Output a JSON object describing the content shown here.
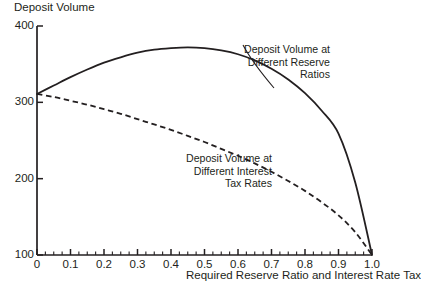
{
  "chart_data": {
    "type": "line",
    "title": "",
    "ylabel": "Deposit Volume",
    "xlabel": "Required Reserve Ratio and Interest Rate Tax",
    "xlim": [
      0,
      1.0
    ],
    "ylim": [
      100,
      400
    ],
    "grid": false,
    "legend_position": "inline-annotation",
    "x_ticks": [
      "0",
      "0.1",
      "0.2",
      "0.3",
      "0.4",
      "0.5",
      "0.6",
      "0.7",
      "0.8",
      "0.9",
      "1.0"
    ],
    "x_tick_values": [
      0,
      0.1,
      0.2,
      0.3,
      0.4,
      0.5,
      0.6,
      0.7,
      0.8,
      0.9,
      1.0
    ],
    "x_minor_tick_interval": 0.025,
    "y_ticks": [
      "100",
      "200",
      "300",
      "400"
    ],
    "y_tick_values": [
      100,
      200,
      300,
      400
    ],
    "series": [
      {
        "name": "Deposit Volume at Different Reserve Ratios",
        "style": "solid",
        "annotation_lines": [
          "Deposit Volume at",
          "Different Reserve",
          "Ratios"
        ],
        "x": [
          0.0,
          0.05,
          0.1,
          0.15,
          0.2,
          0.25,
          0.3,
          0.35,
          0.4,
          0.45,
          0.5,
          0.55,
          0.6,
          0.65,
          0.7,
          0.75,
          0.8,
          0.85,
          0.9,
          0.95,
          1.0
        ],
        "values": [
          311,
          322,
          333,
          343,
          352,
          359,
          365,
          369,
          371,
          372,
          371,
          368,
          363,
          355,
          344,
          330,
          312,
          289,
          259,
          195,
          100
        ]
      },
      {
        "name": "Deposit Volume at Different Interest Tax Rates",
        "style": "dashed",
        "annotation_lines": [
          "Deposit Volume at",
          "Different Interest",
          "Tax Rates"
        ],
        "x": [
          0.0,
          0.05,
          0.1,
          0.15,
          0.2,
          0.25,
          0.3,
          0.35,
          0.4,
          0.45,
          0.5,
          0.55,
          0.6,
          0.65,
          0.7,
          0.75,
          0.8,
          0.85,
          0.9,
          0.95,
          1.0
        ],
        "values": [
          311,
          307,
          302,
          297,
          291,
          285,
          278,
          271,
          264,
          256,
          248,
          239,
          230,
          220,
          209,
          197,
          184,
          169,
          152,
          130,
          100
        ]
      }
    ]
  },
  "colors": {
    "ink": "#231f20",
    "background": "#ffffff"
  }
}
